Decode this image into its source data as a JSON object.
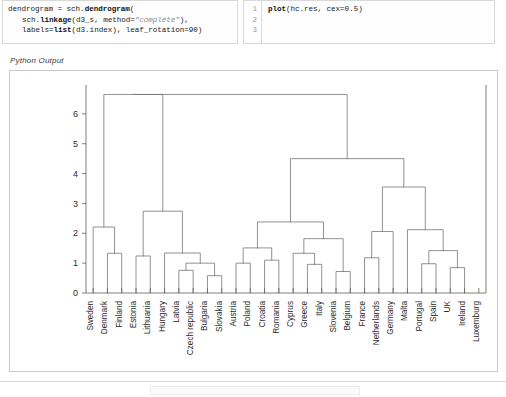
{
  "cells": {
    "python_cell": {
      "lines": [
        "dendrogram = sch.dendrogram(",
        "sch.linkage(d3_s, method=\"complete\"),",
        "labels=list(d3.index), leaf_rotation=90)"
      ],
      "line1_plain": "dendrogram = sch.",
      "line1_bold": "dendrogram",
      "line1_tail": "(",
      "line2_plain": "sch.",
      "line2_bold": "linkage",
      "line2_mid": "(d3_s, method=",
      "line2_str": "\"complete\"",
      "line2_tail": "),",
      "line3_plain": "labels=",
      "line3_bold": "list",
      "line3_tail": "(d3.index), leaf_rotation=90)"
    },
    "r_cell": {
      "gutter": [
        "1",
        "2",
        "3"
      ],
      "line1_bold": "plot",
      "line1_tail": "(hc.res, cex=0.5)"
    }
  },
  "output": {
    "label": "Python Output"
  },
  "chart_data": {
    "type": "dendrogram",
    "title": "",
    "xlabel": "",
    "ylabel": "",
    "ylim": [
      0,
      6.9
    ],
    "yticks": [
      0,
      1,
      2,
      3,
      4,
      5,
      6
    ],
    "ytick_labels": [
      "0",
      "1",
      "2",
      "3",
      "4",
      "5",
      "6"
    ],
    "grid": false,
    "legend": false,
    "n_leaves": 27,
    "leaf_rotation": 90,
    "linkage_method": "complete",
    "leaves": [
      "Sweden",
      "Denmark",
      "Finland",
      "Estonia",
      "Lithuania",
      "Hungary",
      "Latvia",
      "Czech republic",
      "Bulgaria",
      "Slovakia",
      "Austria",
      "Poland",
      "Croatia",
      "Romania",
      "Cyprus",
      "Greece",
      "Italy",
      "Slovenia",
      "Belgium",
      "France",
      "Netherlands",
      "Germany",
      "Malta",
      "Portugal",
      "Spain",
      "UK",
      "Ireland",
      "Luxemburg"
    ],
    "merges": [
      {
        "id": "m1",
        "left": {
          "leaf": 1
        },
        "right": {
          "leaf": 2
        },
        "height": 1.33
      },
      {
        "id": "m2",
        "left": {
          "leaf": 0
        },
        "right": {
          "node": "m1"
        },
        "height": 2.21
      },
      {
        "id": "m3",
        "left": {
          "leaf": 3
        },
        "right": {
          "leaf": 4
        },
        "height": 1.24
      },
      {
        "id": "m4",
        "left": {
          "leaf": 6
        },
        "right": {
          "leaf": 7
        },
        "height": 0.76
      },
      {
        "id": "m5",
        "left": {
          "leaf": 8
        },
        "right": {
          "leaf": 9
        },
        "height": 0.58
      },
      {
        "id": "m6",
        "left": {
          "node": "m4"
        },
        "right": {
          "node": "m5"
        },
        "height": 1.0
      },
      {
        "id": "m7",
        "left": {
          "leaf": 5
        },
        "right": {
          "node": "m6"
        },
        "height": 1.34
      },
      {
        "id": "m8",
        "left": {
          "node": "m3"
        },
        "right": {
          "node": "m7"
        },
        "height": 2.74
      },
      {
        "id": "m9",
        "left": {
          "leaf": 10
        },
        "right": {
          "leaf": 11
        },
        "height": 1.0
      },
      {
        "id": "m10",
        "left": {
          "leaf": 12
        },
        "right": {
          "leaf": 13
        },
        "height": 1.1
      },
      {
        "id": "m11",
        "left": {
          "node": "m9"
        },
        "right": {
          "node": "m10"
        },
        "height": 1.51
      },
      {
        "id": "m12",
        "left": {
          "leaf": 15
        },
        "right": {
          "leaf": 16
        },
        "height": 0.96
      },
      {
        "id": "m13",
        "left": {
          "leaf": 14
        },
        "right": {
          "node": "m12"
        },
        "height": 1.33
      },
      {
        "id": "m14",
        "left": {
          "leaf": 17
        },
        "right": {
          "leaf": 18
        },
        "height": 0.72
      },
      {
        "id": "m15",
        "left": {
          "node": "m13"
        },
        "right": {
          "node": "m14"
        },
        "height": 1.82
      },
      {
        "id": "m16",
        "left": {
          "node": "m11"
        },
        "right": {
          "node": "m15"
        },
        "height": 2.38
      },
      {
        "id": "m17",
        "left": {
          "leaf": 19
        },
        "right": {
          "leaf": 20
        },
        "height": 1.18
      },
      {
        "id": "m18",
        "left": {
          "leaf": 21
        },
        "right": {
          "node": "m17"
        },
        "height": 2.06
      },
      {
        "id": "m19",
        "left": {
          "leaf": 23
        },
        "right": {
          "leaf": 24
        },
        "height": 0.98
      },
      {
        "id": "m20",
        "left": {
          "leaf": 25
        },
        "right": {
          "leaf": 26
        },
        "height": 0.85
      },
      {
        "id": "m21",
        "left": {
          "node": "m19"
        },
        "right": {
          "node": "m20"
        },
        "height": 1.42
      },
      {
        "id": "m22",
        "left": {
          "leaf": 22
        },
        "right": {
          "node": "m21"
        },
        "height": 2.12
      },
      {
        "id": "m23",
        "left": {
          "node": "m18"
        },
        "right": {
          "node": "m22"
        },
        "height": 3.55
      },
      {
        "id": "m24",
        "left": {
          "node": "m16"
        },
        "right": {
          "node": "m23"
        },
        "height": 4.5
      },
      {
        "id": "m25",
        "left": {
          "node": "m2"
        },
        "right": {
          "node": "m8"
        },
        "height": 6.65
      },
      {
        "id": "root",
        "left": {
          "node": "m25"
        },
        "right": {
          "node": "m24"
        },
        "height": 6.65
      }
    ]
  }
}
